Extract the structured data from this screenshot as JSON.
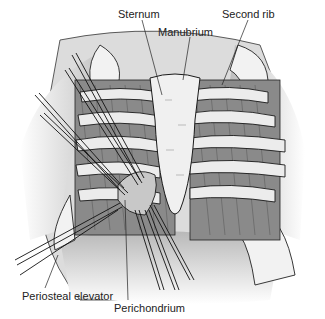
{
  "figure": {
    "labels": {
      "sternum": "Sternum",
      "manubrium": "Manubrium",
      "second_rib": "Second rib",
      "periosteal_elevator": "Periosteal elevator",
      "perichondrium": "Perichondrium"
    },
    "colors": {
      "background": "#ffffff",
      "line": "#1a1a1a",
      "muscle": "#7a7a7a",
      "cartilage": "#e6e6e6",
      "skin": "#d0d0d0"
    }
  }
}
